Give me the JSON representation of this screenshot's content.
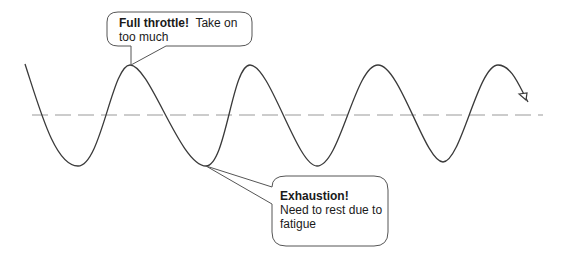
{
  "diagram": {
    "type": "sine-wave-with-callouts",
    "baseline": {
      "style": "dashed",
      "color": "#9a9a9a",
      "y": 115,
      "x_start": 32,
      "x_end": 543
    },
    "wave": {
      "color": "#3a3a3a",
      "peaks": [
        [
          130,
          65
        ],
        [
          250,
          65
        ],
        [
          378,
          65
        ],
        [
          498,
          65
        ]
      ],
      "troughs": [
        [
          78,
          166
        ],
        [
          206,
          166
        ],
        [
          317,
          166
        ],
        [
          443,
          162
        ]
      ],
      "end_arrow": true
    },
    "callouts": [
      {
        "id": "full-throttle",
        "bold": "Full throttle!",
        "text": "Take on too much",
        "points_to": "peak"
      },
      {
        "id": "exhaustion",
        "bold": "Exhaustion!",
        "text": "Need to rest due to fatigue",
        "points_to": "trough"
      }
    ]
  }
}
